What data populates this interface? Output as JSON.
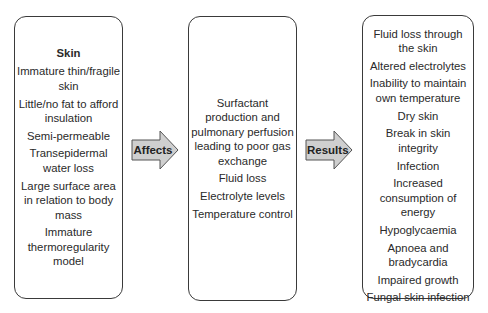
{
  "diagram": {
    "colors": {
      "arrow_fill": "#cfcfcf",
      "border": "#3a3a3a",
      "text": "#2a2a2a"
    },
    "left_box": {
      "title": "Skin",
      "items": [
        "Immature thin/fragile skin",
        "Little/no fat to afford insulation",
        "Semi-permeable",
        "Transepidermal water loss",
        "Large surface area in relation to body mass",
        "Immature thermoregularity model"
      ]
    },
    "arrow1": {
      "label": "Affects"
    },
    "middle_box": {
      "items": [
        "Surfactant production and pulmonary perfusion leading to poor gas exchange",
        "Fluid loss",
        "Electrolyte levels",
        "Temperature control"
      ]
    },
    "arrow2": {
      "label": "Results"
    },
    "right_box": {
      "items": [
        "Fluid loss through the skin",
        "Altered electrolytes",
        "Inability to maintain own temperature",
        "Dry skin",
        "Break in skin integrity",
        "Infection",
        "Increased consumption of energy",
        "Hypoglycaemia",
        "Apnoea and bradycardia",
        "Impaired growth",
        "Fungal skin infection"
      ]
    }
  }
}
